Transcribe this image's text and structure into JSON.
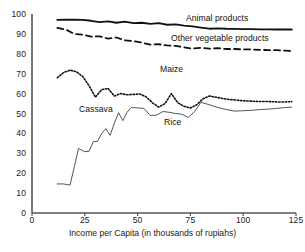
{
  "chart_data": {
    "type": "line",
    "title": "",
    "xlabel": "Income per Capita (in thousands of rupiahs)",
    "ylabel": "",
    "xlim": [
      0,
      125
    ],
    "ylim": [
      0,
      100
    ],
    "xticks": [
      0,
      25,
      50,
      75,
      100,
      125
    ],
    "yticks": [
      0,
      10,
      20,
      30,
      40,
      50,
      60,
      70,
      80,
      90,
      100
    ],
    "xtick_labels": [
      "0",
      "25",
      "50",
      "75",
      "100",
      "125"
    ],
    "ytick_labels": [
      "0",
      "10",
      "20",
      "30",
      "40",
      "50",
      "60",
      "70",
      "80",
      "90",
      "100"
    ],
    "grid": false,
    "legend_position": "inline-annotations",
    "series": [
      {
        "name": "Animal products",
        "style": "solid",
        "width": 1.8,
        "color": "#111111",
        "label_x": 186,
        "label_y": 13,
        "x": [
          12,
          16,
          20,
          24,
          28,
          32,
          36,
          40,
          44,
          48,
          52,
          56,
          60,
          64,
          68,
          72,
          76,
          80,
          84,
          88,
          92,
          96,
          100,
          104,
          108,
          112,
          116,
          120,
          123
        ],
        "y": [
          97.0,
          97.2,
          97.1,
          97.0,
          96.6,
          95.9,
          96.3,
          95.6,
          96.2,
          95.4,
          95.6,
          95.0,
          95.4,
          94.6,
          94.8,
          94.2,
          93.8,
          93.2,
          92.6,
          92.8,
          92.6,
          92.5,
          92.4,
          92.4,
          92.3,
          92.3,
          92.2,
          92.2,
          92.2
        ]
      },
      {
        "name": "Other vegetable products",
        "style": "dashed",
        "width": 1.8,
        "color": "#111111",
        "label_x": 171,
        "label_y": 33,
        "x": [
          12,
          16,
          20,
          24,
          28,
          32,
          36,
          40,
          44,
          48,
          52,
          56,
          60,
          64,
          68,
          72,
          76,
          80,
          84,
          88,
          92,
          96,
          100,
          104,
          108,
          112,
          116,
          120,
          123
        ],
        "y": [
          93.0,
          92.2,
          90.0,
          89.6,
          88.6,
          88.8,
          87.6,
          88.2,
          86.8,
          86.4,
          85.6,
          84.6,
          84.8,
          84.2,
          84.0,
          83.2,
          82.6,
          83.0,
          82.6,
          82.8,
          82.4,
          82.4,
          82.2,
          82.2,
          82.0,
          81.8,
          81.8,
          81.6,
          81.4
        ]
      },
      {
        "name": "Cassava",
        "style": "dotted",
        "width": 1.6,
        "color": "#111111",
        "label_x": 79,
        "label_y": 104,
        "x": [
          12,
          15,
          18,
          21,
          24,
          27,
          30,
          33,
          36,
          39,
          42,
          45,
          48,
          51,
          54,
          57,
          60,
          63,
          66,
          69,
          72,
          75,
          78,
          81,
          84,
          88,
          92,
          96,
          100,
          104,
          108,
          112,
          116,
          120,
          123
        ],
        "y": [
          68.0,
          70.6,
          71.8,
          71.0,
          68.6,
          64.0,
          58.2,
          62.0,
          62.6,
          58.8,
          60.0,
          59.4,
          59.6,
          59.8,
          58.4,
          55.4,
          53.2,
          55.0,
          60.0,
          55.4,
          53.6,
          52.8,
          54.4,
          57.4,
          58.8,
          58.0,
          57.2,
          56.8,
          56.4,
          56.2,
          56.0,
          56.0,
          55.8,
          55.8,
          56.0
        ]
      },
      {
        "name": "Rice",
        "style": "solid",
        "width": 1.0,
        "color": "#555555",
        "label_x": 164,
        "label_y": 117,
        "x": [
          12,
          15,
          18,
          20,
          22,
          25,
          27,
          29,
          31,
          33,
          35,
          37,
          39,
          41,
          43,
          45,
          47,
          50,
          53,
          56,
          59,
          62,
          65,
          68,
          71,
          74,
          77,
          80,
          84,
          88,
          92,
          96,
          100,
          104,
          108,
          112,
          116,
          120,
          123
        ],
        "y": [
          14.6,
          14.6,
          14.0,
          23.0,
          32.4,
          30.8,
          31.0,
          35.8,
          36.0,
          40.0,
          42.4,
          39.0,
          45.2,
          50.4,
          46.4,
          50.6,
          53.0,
          52.8,
          52.6,
          49.0,
          49.2,
          51.0,
          50.6,
          50.0,
          49.6,
          48.0,
          51.0,
          55.6,
          54.4,
          53.0,
          52.0,
          51.2,
          51.4,
          51.6,
          52.0,
          52.2,
          52.6,
          53.0,
          53.2
        ]
      },
      {
        "name": "Maize",
        "style": "annotation-only",
        "width": 0,
        "color": "#111111",
        "label_x": 160,
        "label_y": 64,
        "x": [],
        "y": []
      }
    ]
  },
  "axes": {
    "x_axis_title": "Income per Capita (in thousands of rupiahs)",
    "axis_color": "#555555"
  }
}
